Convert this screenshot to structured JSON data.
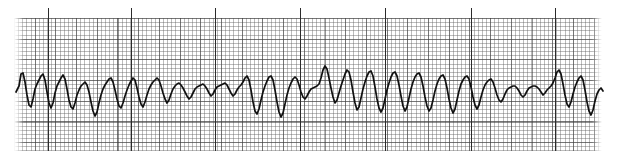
{
  "strip": {
    "kind": "ecg-rhythm-strip",
    "paper": {
      "background_color": "#ffffff",
      "fine_grid_color": "#5f5f5f",
      "bold_grid_color": "#3c3c3c",
      "fine_grid_spacing_px": 4.14,
      "bold_grid_spacing_px": 20.7,
      "grid_left_px": 14,
      "grid_top_px": 18,
      "grid_width_px": 588,
      "grid_height_px": 133
    },
    "trace": {
      "color": "#111111",
      "stroke_width_px": 1.7,
      "baseline_y_px": 90,
      "label": "ecg-waveform"
    },
    "markers": {
      "label": "interval-marker-tick",
      "color": "#2b2b2b",
      "x_positions_px": [
        48,
        131,
        215,
        300,
        385,
        471,
        555
      ]
    }
  },
  "chart_data": {
    "type": "line",
    "title": "",
    "xlabel": "",
    "ylabel": "",
    "grid": true,
    "legend_position": "none",
    "x_range_px": [
      16,
      604
    ],
    "y_range_px": [
      60,
      130
    ],
    "baseline_px": 90,
    "series": [
      {
        "name": "ecg-lead-trace",
        "points": "16,92 19,86 21,74 23,73 25,82 27,95 29,105 31,107 33,99 35,89 37,84 39,80 41,76 43,74 45,80 47,92 49,103 51,108 53,103 55,93 57,86 59,82 61,78 63,75 65,79 67,89 69,100 71,107 73,109 75,103 77,95 79,90 81,86 83,84 85,82 87,85 89,92 91,102 93,111 95,116 97,112 99,103 101,95 103,89 105,85 107,82 109,79 111,78 113,82 115,90 117,99 119,106 121,108 123,103 125,96 127,90 129,85 131,81 133,78 135,80 137,88 139,97 141,104 143,107 145,102 147,95 149,89 151,85 153,82 155,80 157,78 159,80 161,86 163,93 165,99 167,103 169,100 171,94 173,89 175,86 177,84 179,83 181,85 183,88 185,92 187,96 189,99 191,97 193,93 195,89 197,87 199,86 201,85 203,84 205,86 207,89 209,93 211,96 213,94 215,90 217,87 219,86 221,85 223,84 225,83 227,85 229,89 231,93 233,96 235,94 237,90 239,87 241,85 243,82 245,78 247,76 249,80 251,90 253,102 255,111 257,114 259,109 261,100 263,92 265,86 267,81 269,77 271,76 273,80 275,90 277,102 279,112 281,117 283,113 285,104 287,95 289,88 291,83 293,79 295,77 297,79 299,85 301,92 303,97 305,99 307,96 309,92 311,89 313,88 315,87 317,86 319,84 321,78 323,70 325,66 327,69 329,78 331,88 333,97 335,103 337,100 339,93 341,86 343,80 345,74 347,70 349,72 351,80 353,92 355,103 357,110 359,107 361,98 363,89 365,82 367,76 369,72 371,71 373,76 375,87 377,99 379,108 381,112 383,108 385,99 387,90 389,83 391,77 393,73 395,72 397,76 399,85 401,96 403,106 405,111 407,107 409,98 411,89 413,82 415,77 417,74 419,73 421,77 423,86 425,97 427,106 429,111 431,108 433,100 435,91 437,84 439,79 441,76 443,75 445,79 447,88 449,99 451,108 453,113 455,109 457,100 459,91 461,84 463,80 465,77 467,76 469,79 471,87 473,97 475,105 477,109 479,105 481,97 483,90 485,85 487,82 489,80 491,79 493,82 495,88 497,95 499,100 501,102 503,99 505,94 507,90 509,88 511,87 513,86 515,86 517,88 519,91 521,95 523,97 525,95 527,91 529,88 531,87 533,86 535,86 537,87 539,89 541,92 543,95 545,93 547,90 549,88 551,86 553,83 555,78 557,72 559,70 561,74 563,84 565,95 567,104 569,107 571,102 573,94 575,87 577,82 579,78 581,76 583,80 585,90 587,102 589,111 591,115 593,110 595,101 597,94 599,90 601,88 603,91"
      }
    ]
  }
}
